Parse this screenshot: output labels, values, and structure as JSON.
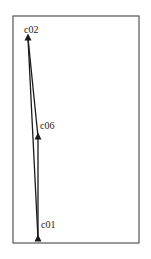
{
  "diagram": {
    "type": "point-path",
    "frame": {
      "x": 13,
      "y": 16,
      "width": 126,
      "height": 227,
      "stroke": "#555555"
    },
    "line_color": "#1a1a1a",
    "marker": "triangle",
    "points": [
      {
        "id": "c01",
        "label": "c01",
        "x": 38,
        "y": 239,
        "label_x": 41,
        "label_y": 228
      },
      {
        "id": "c02",
        "label": "c02",
        "x": 28,
        "y": 38,
        "label_x": 24,
        "label_y": 33
      },
      {
        "id": "c06",
        "label": "c06",
        "x": 38,
        "y": 137,
        "label_x": 40,
        "label_y": 129
      }
    ],
    "edges": [
      [
        "c01",
        "c02"
      ],
      [
        "c02",
        "c06"
      ],
      [
        "c06",
        "c01"
      ]
    ]
  }
}
